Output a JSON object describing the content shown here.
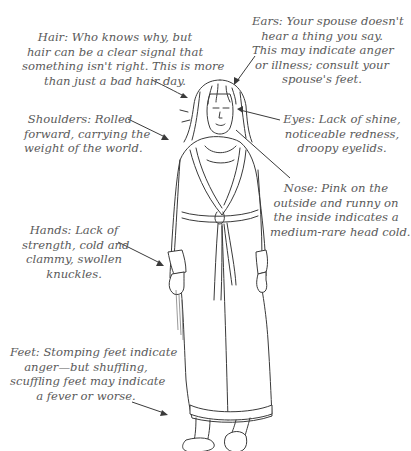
{
  "diagram": {
    "type": "annotated-illustration",
    "text_color": "#5a5a5a",
    "line_color": "#3a3a3a",
    "annotations": {
      "hair": {
        "lines": [
          "Hair: Who knows why, but",
          "hair can be a clear signal that",
          "something isn't right. This is more",
          "than just a bad hair day."
        ]
      },
      "ears": {
        "lines": [
          "Ears: Your spouse doesn't",
          "hear a thing you say.",
          "This may indicate anger",
          "or illness; consult your",
          "spouse's feet."
        ]
      },
      "shoulders": {
        "lines": [
          "Shoulders: Rolled",
          "forward, carrying the",
          "weight of the world."
        ]
      },
      "eyes": {
        "lines": [
          "Eyes: Lack of shine,",
          "noticeable redness,",
          "droopy eyelids."
        ]
      },
      "nose": {
        "lines": [
          "Nose: Pink on the",
          "outside and runny on",
          "the inside indicates a",
          "medium-rare head cold."
        ]
      },
      "hands": {
        "lines": [
          "Hands: Lack of",
          "strength, cold and",
          "clammy, swollen",
          "knuckles."
        ]
      },
      "feet": {
        "lines": [
          "Feet: Stomping feet indicate",
          "anger—but shuffling,",
          "scuffling feet may indicate",
          "a fever or worse."
        ]
      }
    }
  }
}
